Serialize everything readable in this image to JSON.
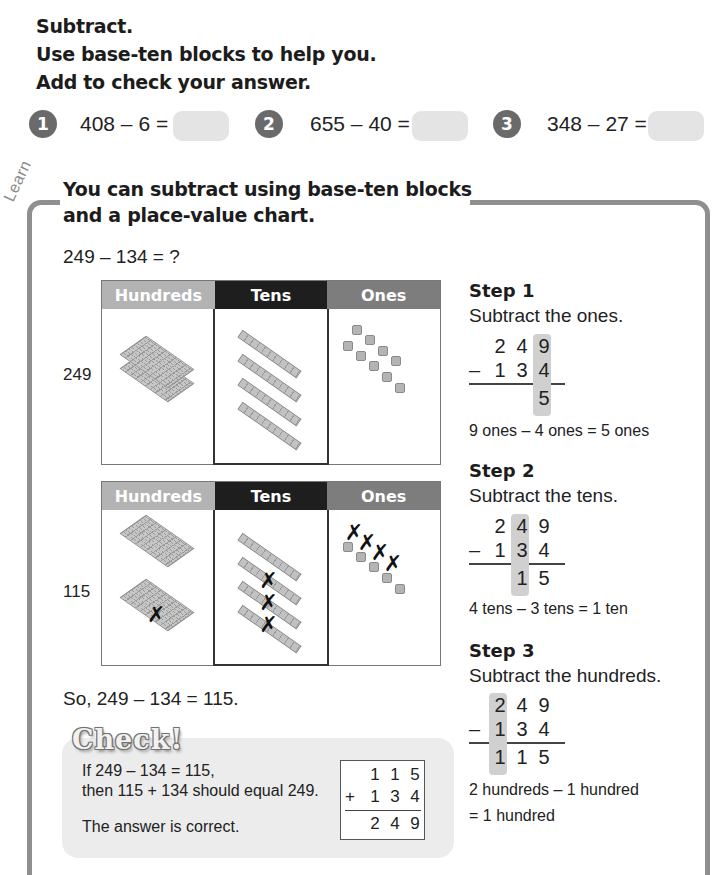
{
  "instructions": {
    "line1": "Subtract.",
    "line2": "Use base-ten blocks to help you.",
    "line3": "Add to check your answer."
  },
  "questions": [
    {
      "number": "1",
      "expression": "408 – 6 =",
      "answer": ""
    },
    {
      "number": "2",
      "expression": "655 – 40 =",
      "answer": ""
    },
    {
      "number": "3",
      "expression": "348 – 27 =",
      "answer": ""
    }
  ],
  "learn": {
    "tag": "Learn",
    "heading_line1": "You can subtract using base-ten blocks",
    "heading_line2": "and a place-value chart.",
    "problem": "249 – 134 = ?",
    "chart_headers": {
      "hundreds": "Hundreds",
      "tens": "Tens",
      "ones": "Ones"
    },
    "chart1_label": "249",
    "chart2_label": "115",
    "conclusion": "So, 249 – 134 = 115."
  },
  "steps": [
    {
      "title": "Step 1",
      "desc": "Subtract the ones.",
      "top": [
        "2",
        "4",
        "9"
      ],
      "bottom": [
        "1",
        "3",
        "4"
      ],
      "result": [
        "",
        "",
        "5"
      ],
      "note_line1": "9 ones – 4 ones = 5 ones",
      "note_line2": ""
    },
    {
      "title": "Step 2",
      "desc": "Subtract the tens.",
      "top": [
        "2",
        "4",
        "9"
      ],
      "bottom": [
        "1",
        "3",
        "4"
      ],
      "result": [
        "",
        "1",
        "5"
      ],
      "note_line1": "4 tens – 3 tens = 1 ten",
      "note_line2": ""
    },
    {
      "title": "Step 3",
      "desc": "Subtract the hundreds.",
      "top": [
        "2",
        "4",
        "9"
      ],
      "bottom": [
        "1",
        "3",
        "4"
      ],
      "result": [
        "1",
        "1",
        "5"
      ],
      "note_line1": "2 hundreds – 1 hundred",
      "note_line2": "= 1 hundred"
    }
  ],
  "minus_sign": "–",
  "plus_sign": "+",
  "check": {
    "title": "Check!",
    "line1": "If 249 – 134 = 115,",
    "line2": "then 115 + 134 should equal 249.",
    "line3": "The answer is correct.",
    "addend1": [
      "1",
      "1",
      "5"
    ],
    "addend2": [
      "1",
      "3",
      "4"
    ],
    "sum": [
      "2",
      "4",
      "9"
    ]
  },
  "colors": {
    "frame": "#8f8f8f",
    "hundreds_header": "#b3b3b3",
    "tens_header": "#1e1e1e",
    "ones_header": "#7d7d7d",
    "highlight": "#d0d0d0",
    "check_panel": "#ececec"
  }
}
